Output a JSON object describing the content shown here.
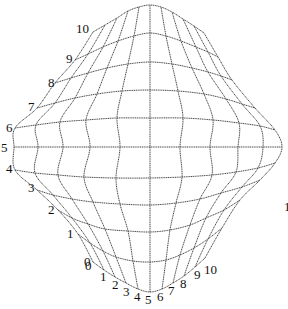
{
  "diagram": {
    "type": "deformed-grid-mesh",
    "grid_size": {
      "columns": 11,
      "rows": 11
    },
    "row_labels": [
      "0",
      "1",
      "2",
      "3",
      "4",
      "5",
      "6",
      "7",
      "8",
      "9",
      "10"
    ],
    "column_labels": [
      "0",
      "1",
      "2",
      "3",
      "4",
      "5",
      "6",
      "7",
      "8",
      "9",
      "10"
    ],
    "stray_label": "1",
    "line_color": "#333333",
    "label_color": "#111111",
    "rows": [
      [
        [
          93,
          262
        ],
        [
          104,
          270
        ],
        [
          115,
          277
        ],
        [
          126,
          283
        ],
        [
          138,
          289
        ],
        [
          150,
          292
        ],
        [
          162,
          289
        ],
        [
          173,
          283
        ],
        [
          184,
          276
        ],
        [
          195,
          267
        ],
        [
          205,
          258
        ]
      ],
      [
        [
          78,
          234
        ],
        [
          90,
          243
        ],
        [
          103,
          251
        ],
        [
          116,
          257
        ],
        [
          133,
          261
        ],
        [
          150,
          262
        ],
        [
          166,
          260
        ],
        [
          180,
          255
        ],
        [
          194,
          248
        ],
        [
          208,
          239
        ],
        [
          222,
          228
        ]
      ],
      [
        [
          58,
          210
        ],
        [
          72,
          218
        ],
        [
          88,
          224
        ],
        [
          105,
          229
        ],
        [
          128,
          231
        ],
        [
          150,
          232
        ],
        [
          170,
          230
        ],
        [
          190,
          225
        ],
        [
          206,
          218
        ],
        [
          224,
          210
        ],
        [
          240,
          200
        ]
      ],
      [
        [
          37,
          190
        ],
        [
          53,
          195
        ],
        [
          72,
          199
        ],
        [
          93,
          202
        ],
        [
          120,
          204
        ],
        [
          150,
          205
        ],
        [
          176,
          203
        ],
        [
          200,
          199
        ],
        [
          221,
          193
        ],
        [
          242,
          187
        ],
        [
          260,
          180
        ]
      ],
      [
        [
          15,
          170
        ],
        [
          35,
          173
        ],
        [
          58,
          175
        ],
        [
          84,
          177
        ],
        [
          116,
          178
        ],
        [
          150,
          178
        ],
        [
          182,
          177
        ],
        [
          212,
          175
        ],
        [
          236,
          172
        ],
        [
          258,
          168
        ],
        [
          275,
          163
        ]
      ],
      [
        [
          14,
          147
        ],
        [
          38,
          147
        ],
        [
          63,
          147
        ],
        [
          90,
          147
        ],
        [
          120,
          147
        ],
        [
          150,
          147
        ],
        [
          180,
          147
        ],
        [
          210,
          147
        ],
        [
          238,
          147
        ],
        [
          263,
          147
        ],
        [
          282,
          147
        ]
      ],
      [
        [
          15,
          128
        ],
        [
          36,
          125
        ],
        [
          60,
          122
        ],
        [
          86,
          120
        ],
        [
          117,
          118
        ],
        [
          150,
          118
        ],
        [
          183,
          118
        ],
        [
          213,
          120
        ],
        [
          239,
          123
        ],
        [
          260,
          126
        ],
        [
          275,
          130
        ]
      ],
      [
        [
          37,
          108
        ],
        [
          55,
          103
        ],
        [
          75,
          98
        ],
        [
          97,
          94
        ],
        [
          122,
          91
        ],
        [
          150,
          90
        ],
        [
          178,
          91
        ],
        [
          204,
          94
        ],
        [
          226,
          99
        ],
        [
          242,
          104
        ],
        [
          255,
          108
        ]
      ],
      [
        [
          55,
          83
        ],
        [
          71,
          78
        ],
        [
          88,
          73
        ],
        [
          107,
          68
        ],
        [
          128,
          64
        ],
        [
          150,
          62
        ],
        [
          172,
          64
        ],
        [
          192,
          68
        ],
        [
          208,
          72
        ],
        [
          221,
          76
        ],
        [
          232,
          80
        ]
      ],
      [
        [
          75,
          60
        ],
        [
          88,
          54
        ],
        [
          103,
          47
        ],
        [
          118,
          41
        ],
        [
          134,
          36
        ],
        [
          150,
          33
        ],
        [
          166,
          36
        ],
        [
          181,
          41
        ],
        [
          196,
          47
        ],
        [
          208,
          52
        ],
        [
          218,
          57
        ]
      ],
      [
        [
          93,
          32
        ],
        [
          105,
          25
        ],
        [
          117,
          18
        ],
        [
          128,
          11
        ],
        [
          139,
          7
        ],
        [
          150,
          5
        ],
        [
          161,
          7
        ],
        [
          172,
          12
        ],
        [
          183,
          19
        ],
        [
          194,
          26
        ],
        [
          204,
          33
        ]
      ]
    ],
    "row_label_positions": [
      [
        84,
        266
      ],
      [
        67,
        238
      ],
      [
        48,
        214
      ],
      [
        28,
        192
      ],
      [
        6,
        173
      ],
      [
        1,
        152
      ],
      [
        6,
        132
      ],
      [
        28,
        111
      ],
      [
        48,
        87
      ],
      [
        66,
        63
      ],
      [
        76,
        33
      ]
    ],
    "column_label_positions": [
      [
        85,
        270
      ],
      [
        100,
        281
      ],
      [
        112,
        289
      ],
      [
        123,
        296
      ],
      [
        134,
        301
      ],
      [
        145,
        304
      ],
      [
        157,
        301
      ],
      [
        168,
        295
      ],
      [
        180,
        288
      ],
      [
        194,
        279
      ],
      [
        204,
        274
      ]
    ],
    "stray_label_position": [
      284,
      211
    ]
  }
}
